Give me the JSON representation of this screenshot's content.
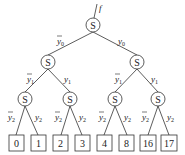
{
  "diagram": {
    "type": "binary-decision-tree",
    "root_label": "f",
    "node_label": "S",
    "edge_labels": {
      "level0": {
        "left": "y0-bar",
        "right": "y0",
        "var": "y",
        "sub": "0"
      },
      "level1": {
        "left": "y1-bar",
        "right": "y1",
        "var": "y",
        "sub": "1"
      },
      "level2": {
        "left": "y2-bar",
        "right": "y2",
        "var": "y",
        "sub": "2"
      }
    },
    "leaves": [
      "0",
      "1",
      "2",
      "3",
      "4",
      "8",
      "16",
      "17"
    ]
  },
  "text": {
    "f": "f",
    "S": "S",
    "y": "y",
    "s0": "0",
    "s1": "1",
    "s2": "2",
    "leaf0": "0",
    "leaf1": "1",
    "leaf2": "2",
    "leaf3": "3",
    "leaf4": "4",
    "leaf5": "8",
    "leaf6": "16",
    "leaf7": "17"
  }
}
